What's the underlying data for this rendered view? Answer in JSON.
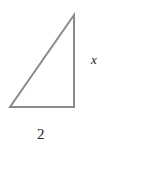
{
  "diagram": {
    "type": "right-triangle",
    "stroke_color": "#8a8a8a",
    "vertices": {
      "top": [
        74,
        15
      ],
      "bottom_left": [
        10,
        107
      ],
      "bottom_right": [
        74,
        107
      ]
    },
    "labels": {
      "vertical_side": "x",
      "base": "2"
    }
  }
}
